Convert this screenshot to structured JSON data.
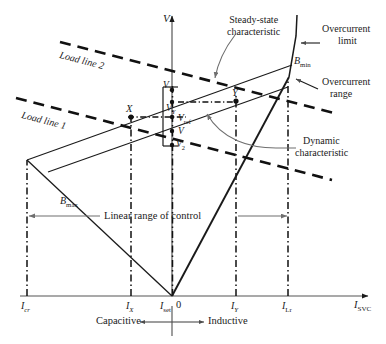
{
  "figure": {
    "type": "svc-v-i-characteristic",
    "axes": {
      "y_axis_label": "V",
      "x_axis_label": "I",
      "x_axis_sub": "SVC",
      "origin_label": "0"
    },
    "x_ticks": [
      {
        "name": "I",
        "sub": "cr",
        "x": 27
      },
      {
        "name": "I",
        "sub": "X",
        "x": 131
      },
      {
        "name": "I",
        "sub": "set",
        "x": 172
      },
      {
        "name": "I",
        "sub": "Y",
        "x": 236
      },
      {
        "name": "I",
        "sub": "Lr",
        "x": 288
      }
    ],
    "voltage_levels": [
      {
        "name": "V",
        "sub": "1",
        "y": 90
      },
      {
        "name": "V",
        "sub": "Y",
        "y": 104
      },
      {
        "name": "V",
        "sub": "ref",
        "y": 119
      },
      {
        "name": "V",
        "sub": "",
        "y": 131
      },
      {
        "name": "V",
        "sub": "2",
        "y": 143
      }
    ],
    "points": [
      {
        "label": "X",
        "x": 131,
        "y": 117
      },
      {
        "label": "Y",
        "x": 236,
        "y": 101
      }
    ],
    "annotations": {
      "steady_state": "Steady-state\ncharacteristic",
      "steady_state_line1": "Steady-state",
      "steady_state_line2": "characteristic",
      "dynamic": "Dynamic\ncharacteristic",
      "dynamic_line1": "Dynamic",
      "dynamic_line2": "characteristic",
      "overcurrent_limit_line1": "Overcurrent",
      "overcurrent_limit_line2": "limit",
      "overcurrent_range_line1": "Overcurrent",
      "overcurrent_range_line2": "range",
      "load_line_1": "Load line 1",
      "load_line_2": "Load line 2",
      "linear_range": "Linear range of control",
      "capacitive": "Capacitive",
      "inductive": "Inductive"
    },
    "susceptance": [
      {
        "name": "B",
        "sub": "max"
      },
      {
        "name": "B",
        "sub": "min"
      }
    ],
    "colors": {
      "stroke": "#1a1a1a",
      "leader": "#6f6f6f",
      "background": "#ffffff"
    }
  }
}
